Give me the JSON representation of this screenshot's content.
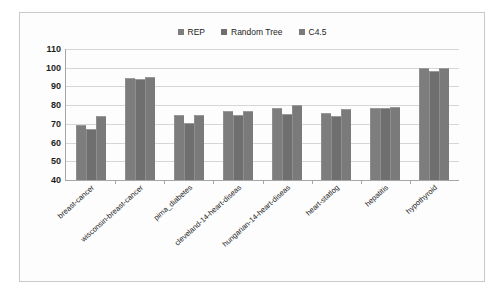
{
  "chart_data": {
    "type": "bar",
    "title": "",
    "xlabel": "",
    "ylabel": "",
    "ylim": [
      40,
      110
    ],
    "ytick_step": 10,
    "yticks": [
      110,
      100,
      90,
      80,
      70,
      60,
      50,
      40
    ],
    "grid": true,
    "legend_position": "top-center",
    "categories": [
      "breast-cancer",
      "wisconsin-breast-cancer",
      "pima_diabetes",
      "cleveland-14-heart-diseas",
      "hungarian-14-heart-diseas",
      "heart-statlog",
      "hepatitis",
      "hypothyroid"
    ],
    "series": [
      {
        "name": "REP",
        "color": "#7d7d7d",
        "values": [
          69.5,
          94.5,
          74.5,
          77.0,
          78.5,
          76.0,
          78.5,
          100.0
        ]
      },
      {
        "name": "Random Tree",
        "color": "#6f6f6f",
        "values": [
          67.3,
          94.0,
          70.3,
          75.0,
          75.5,
          74.3,
          78.5,
          98.5
        ]
      },
      {
        "name": "C4.5",
        "color": "#7a7a7a",
        "values": [
          74.0,
          95.0,
          74.5,
          77.0,
          80.0,
          78.0,
          79.0,
          100.0
        ]
      }
    ]
  },
  "colors": {
    "frame_border": "#c9c9c9",
    "gridline": "#d6d6d6",
    "axis": "#a6a6a6",
    "background": "#fdfdfd",
    "text": "#1d1d1d"
  }
}
